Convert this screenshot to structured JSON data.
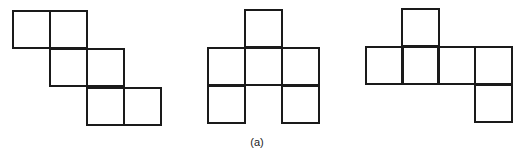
{
  "figure": {
    "caption": "(a)",
    "stroke_color": "#1a1a1a",
    "background": "#ffffff",
    "cell_size": 37,
    "nets": [
      {
        "name": "staircase-net",
        "cells": [
          [
            13,
            11
          ],
          [
            50,
            11
          ],
          [
            50,
            49
          ],
          [
            87,
            49
          ],
          [
            87,
            88
          ],
          [
            124,
            88
          ]
        ]
      },
      {
        "name": "arch-net",
        "cells": [
          [
            245,
            10
          ],
          [
            208,
            48
          ],
          [
            245,
            48
          ],
          [
            282,
            48
          ],
          [
            208,
            86
          ],
          [
            282,
            86
          ]
        ]
      },
      {
        "name": "row-net",
        "cells": [
          [
            402,
            9
          ],
          [
            366,
            47
          ],
          [
            402,
            47
          ],
          [
            438,
            47
          ],
          [
            475,
            47
          ],
          [
            475,
            85
          ]
        ]
      }
    ]
  }
}
